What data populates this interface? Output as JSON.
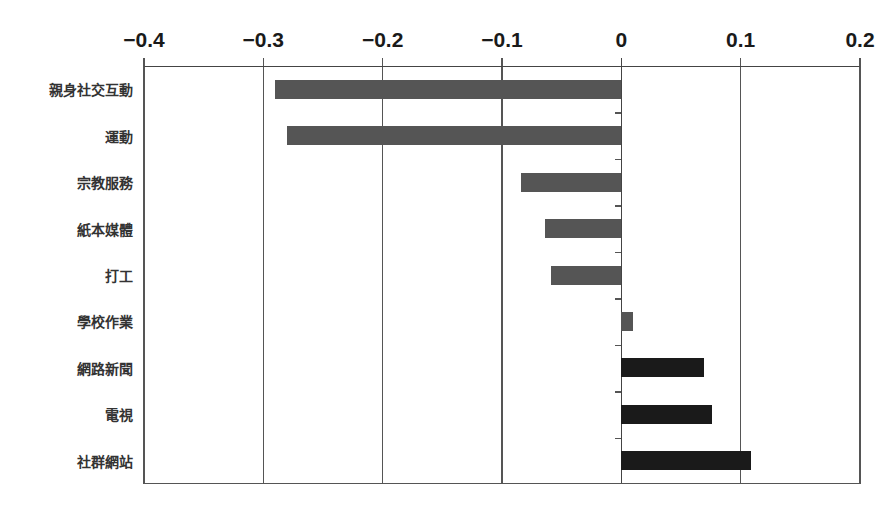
{
  "chart_data": {
    "type": "bar",
    "orientation": "horizontal",
    "title": "",
    "xlabel": "",
    "ylabel": "",
    "xlim": [
      -0.4,
      0.2
    ],
    "x_ticks": [
      -0.4,
      -0.3,
      -0.2,
      -0.1,
      0,
      0.1,
      0.2
    ],
    "x_tick_labels": [
      "−0.4",
      "−0.3",
      "−0.2",
      "−0.1",
      "0",
      "0.1",
      "0.2"
    ],
    "x_axis_position": "top",
    "grid": "vertical",
    "legend": null,
    "categories": [
      "親身社交互動",
      "運動",
      "宗教服務",
      "紙本媒體",
      "打工",
      "學校作業",
      "網路新聞",
      "電視",
      "社群網站"
    ],
    "values": [
      -0.29,
      -0.28,
      -0.084,
      -0.064,
      -0.059,
      0.01,
      0.069,
      0.076,
      0.109
    ],
    "bar_colors": [
      "#555555",
      "#555555",
      "#555555",
      "#555555",
      "#555555",
      "#555555",
      "#1a1a1a",
      "#1a1a1a",
      "#1a1a1a"
    ]
  }
}
